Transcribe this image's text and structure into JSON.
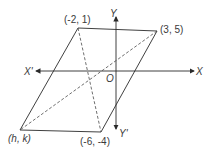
{
  "diagram": {
    "type": "parallelogram-on-axes",
    "vertices": {
      "top_left": "(-2, 1)",
      "top_right": "(3, 5)",
      "bottom_right": "(-6, -4)",
      "bottom_left": "(h, k)"
    },
    "axes": {
      "x_positive": "X",
      "x_negative": "X'",
      "y_positive": "Y",
      "y_negative": "Y'",
      "origin": "O"
    },
    "diagonals": "dashed",
    "colors": {
      "stroke": "#2a2a2a",
      "label": "#3a3a3a",
      "background": "#ffffff"
    }
  }
}
